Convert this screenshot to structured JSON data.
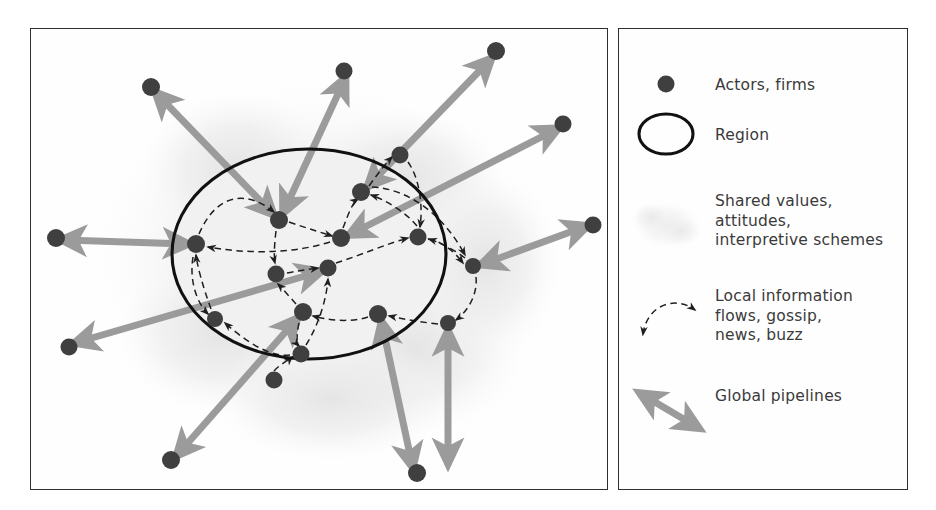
{
  "figure": {
    "type": "diagram",
    "panels": [
      "diagram-panel",
      "legend-panel"
    ]
  },
  "legend": {
    "items": [
      {
        "key": "actors",
        "symbol": "filled-dot",
        "label": "Actors, firms"
      },
      {
        "key": "region",
        "symbol": "ellipse-outline",
        "label": "Region"
      },
      {
        "key": "shared",
        "symbol": "gray-cloud",
        "label": "Shared values,\nattitudes,\ninterpretive schemes"
      },
      {
        "key": "local",
        "symbol": "dashed-curved-arrow",
        "label": "Local information\nflows, gossip,\nnews, buzz"
      },
      {
        "key": "global",
        "symbol": "thick-gray-double-arrow",
        "label": "Global pipelines"
      }
    ]
  },
  "colors": {
    "node": "#3f3f3f",
    "pipeline": "#9b9b9b",
    "buzz": "#1f1f1f",
    "region_stroke": "#111111",
    "region_fill": "#f1f1f1",
    "cloud": "#ececec",
    "frame": "#2e2e2e",
    "text": "#3a3a3a"
  },
  "diagram": {
    "region": {
      "cx": 278,
      "cy": 225,
      "rx": 137,
      "ry": 105
    },
    "inner_nodes": [
      {
        "id": "i1",
        "x": 248,
        "y": 191
      },
      {
        "id": "i2",
        "x": 330,
        "y": 163
      },
      {
        "id": "i3",
        "x": 369,
        "y": 126
      },
      {
        "id": "i4",
        "x": 310,
        "y": 209
      },
      {
        "id": "i5",
        "x": 387,
        "y": 208
      },
      {
        "id": "i6",
        "x": 165,
        "y": 215
      },
      {
        "id": "i7",
        "x": 245,
        "y": 245
      },
      {
        "id": "i8",
        "x": 297,
        "y": 239
      },
      {
        "id": "i9",
        "x": 272,
        "y": 283
      },
      {
        "id": "i10",
        "x": 347,
        "y": 285
      },
      {
        "id": "i11",
        "x": 184,
        "y": 290
      },
      {
        "id": "i12",
        "x": 270,
        "y": 325
      },
      {
        "id": "i13",
        "x": 442,
        "y": 237
      },
      {
        "id": "i14",
        "x": 417,
        "y": 294
      }
    ],
    "outer_nodes": [
      {
        "id": "o1",
        "x": 120,
        "y": 58
      },
      {
        "id": "o2",
        "x": 313,
        "y": 42
      },
      {
        "id": "o3",
        "x": 465,
        "y": 22
      },
      {
        "id": "o4",
        "x": 532,
        "y": 95
      },
      {
        "id": "o5",
        "x": 562,
        "y": 196
      },
      {
        "id": "o6",
        "x": 25,
        "y": 209
      },
      {
        "id": "o7",
        "x": 38,
        "y": 318
      },
      {
        "id": "o8",
        "x": 243,
        "y": 351
      },
      {
        "id": "o9",
        "x": 140,
        "y": 431
      },
      {
        "id": "o10",
        "x": 386,
        "y": 444
      },
      {
        "id": "o11",
        "x": 417,
        "y": 440
      }
    ],
    "pipelines": [
      {
        "from": "o1",
        "to": "i1",
        "heads": "both"
      },
      {
        "from": "o2",
        "to": "i1",
        "heads": "both"
      },
      {
        "from": "o3",
        "to": "i2",
        "heads": "both"
      },
      {
        "from": "o4",
        "to": "i4",
        "heads": "both"
      },
      {
        "from": "o5",
        "to": "i13",
        "heads": "both"
      },
      {
        "from": "o6",
        "to": "i6",
        "heads": "both"
      },
      {
        "from": "o7",
        "to": "i8",
        "heads": "both"
      },
      {
        "from": "o9",
        "to": "i9",
        "heads": "both"
      },
      {
        "from": "o10",
        "to": "i10",
        "heads": "both"
      },
      {
        "from": "o11",
        "to": "i14",
        "heads": "both"
      }
    ],
    "buzz_links": [
      {
        "from": "i6",
        "to": "i1"
      },
      {
        "from": "i1",
        "to": "i4"
      },
      {
        "from": "i4",
        "to": "i2"
      },
      {
        "from": "i2",
        "to": "i3"
      },
      {
        "from": "i3",
        "to": "i5"
      },
      {
        "from": "i5",
        "to": "i13"
      },
      {
        "from": "i13",
        "to": "i14"
      },
      {
        "from": "i14",
        "to": "i10"
      },
      {
        "from": "i10",
        "to": "i9"
      },
      {
        "from": "i9",
        "to": "i12"
      },
      {
        "from": "i12",
        "to": "i11"
      },
      {
        "from": "i11",
        "to": "i6"
      },
      {
        "from": "i7",
        "to": "i8"
      },
      {
        "from": "i8",
        "to": "i5"
      },
      {
        "from": "i4",
        "to": "i6"
      },
      {
        "from": "i5",
        "to": "i2"
      },
      {
        "from": "i12",
        "to": "i8"
      },
      {
        "from": "i9",
        "to": "i7"
      },
      {
        "from": "o8",
        "to": "i12"
      }
    ],
    "counts": {
      "inner_nodes": 14,
      "outer_nodes": 11,
      "pipelines": 10
    }
  }
}
